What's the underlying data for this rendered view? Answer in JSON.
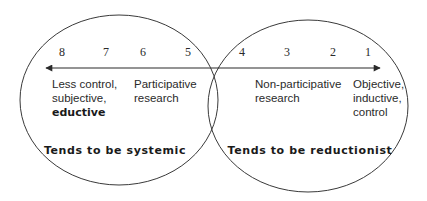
{
  "diagram": {
    "type": "venn-continuum",
    "colors": {
      "stroke": "#3a3a3a",
      "text": "#2a2a2a",
      "background": "#ffffff"
    },
    "scale": {
      "numbers": [
        "8",
        "7",
        "6",
        "5",
        "4",
        "3",
        "2",
        "1"
      ],
      "arrow": "double-headed horizontal arrow"
    },
    "left": {
      "descriptor_lines": [
        "Less control,",
        "subjective,",
        "eductive"
      ],
      "method_lines": [
        "Participative",
        "research"
      ],
      "tendency": "Tends to be systemic"
    },
    "right": {
      "method_lines": [
        "Non-participative",
        "research"
      ],
      "descriptor_lines": [
        "Objective,",
        "inductive,",
        "control"
      ],
      "tendency": "Tends to be reductionist"
    }
  }
}
